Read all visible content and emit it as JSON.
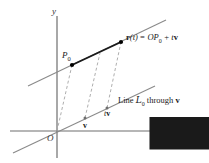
{
  "figure": {
    "background": "#ffffff",
    "width": 209,
    "height": 163,
    "colors": {
      "axis": "#6e6e6e",
      "line": "#7d7d7d",
      "bold_segment": "#1a1a1a",
      "dashed": "#9a9a9a",
      "text": "#1a1a1a",
      "point": "#000000"
    }
  },
  "axes": {
    "y_label": "y",
    "x_label": "x",
    "origin_label": "O"
  },
  "points": {
    "p0_label": "P",
    "p0_sub": "0",
    "rt_point_name": "r(t)"
  },
  "vectors": {
    "v_label": "v",
    "tv_label_t": "t",
    "tv_label_v": "v"
  },
  "equation": {
    "lhs_bold": "r",
    "lhs_paren_open": "(",
    "lhs_t": "t",
    "lhs_paren_close": ")",
    "equals": " = ",
    "op_o": "O",
    "op_p": "P",
    "op_sub": "0",
    "plus": " + ",
    "tv_t": "t",
    "tv_v": "v"
  },
  "line_caption": {
    "word_line": "Line ",
    "script_l": "L",
    "script_sub": "0",
    "word_through": " through ",
    "vec_v": "v"
  }
}
